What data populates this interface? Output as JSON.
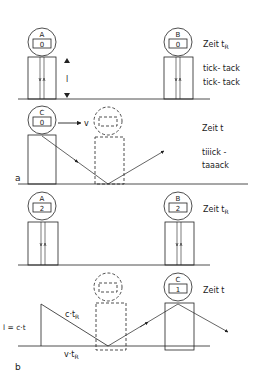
{
  "diagram": {
    "panel_a": {
      "label": "a",
      "clock_A": {
        "name": "A",
        "reading": "0"
      },
      "clock_B": {
        "name": "B",
        "reading": "0"
      },
      "clock_C": {
        "name": "C",
        "reading": "0"
      },
      "length_label": "l",
      "velocity_label": "v",
      "time_label_rest": "Zeit t",
      "time_label_rest_sub": "R",
      "rest_sound_1": "tick- tack",
      "rest_sound_2": "tick- tack",
      "time_label_moving": "Zeit t",
      "moving_sound_1": "tiiick -",
      "moving_sound_2": "taaack"
    },
    "panel_b": {
      "label": "b",
      "clock_A": {
        "name": "A",
        "reading": "2"
      },
      "clock_B": {
        "name": "B",
        "reading": "2"
      },
      "clock_C": {
        "name": "C",
        "reading": "1"
      },
      "time_label_rest": "Zeit t",
      "time_label_rest_sub": "R",
      "time_label_moving": "Zeit t",
      "hyp_label": "c·t",
      "hyp_label_sub": "R",
      "base_label": "v·t",
      "base_label_sub": "R",
      "height_label": "l = c·t"
    },
    "colors": {
      "line": "#222222",
      "background": "#ffffff"
    }
  }
}
